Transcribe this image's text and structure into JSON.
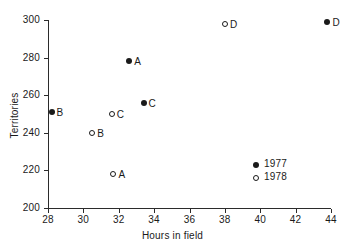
{
  "chart_data": {
    "type": "scatter",
    "title": "",
    "xlabel": "Hours in field",
    "ylabel": "Territories",
    "xlim": [
      28,
      44
    ],
    "ylim": [
      200,
      300
    ],
    "xticks": [
      28,
      30,
      32,
      34,
      36,
      38,
      40,
      42,
      44
    ],
    "yticks": [
      200,
      220,
      240,
      260,
      280,
      300
    ],
    "grid": false,
    "legend_position": "inside-right-lower",
    "series": [
      {
        "name": "1977",
        "marker": "filled-circle",
        "color": "#1a1a1a",
        "points": [
          {
            "label": "B",
            "x": 28.2,
            "y": 251
          },
          {
            "label": "A",
            "x": 32.6,
            "y": 278
          },
          {
            "label": "C",
            "x": 33.4,
            "y": 256
          },
          {
            "label": "D",
            "x": 43.8,
            "y": 299
          }
        ]
      },
      {
        "name": "1978",
        "marker": "open-circle",
        "color": "#1a1a1a",
        "points": [
          {
            "label": "B",
            "x": 30.5,
            "y": 240
          },
          {
            "label": "C",
            "x": 31.6,
            "y": 250
          },
          {
            "label": "A",
            "x": 31.7,
            "y": 218
          },
          {
            "label": "D",
            "x": 38.0,
            "y": 298
          }
        ]
      }
    ]
  },
  "legend": {
    "entries": [
      {
        "label": "1977",
        "marker": "filled-circle"
      },
      {
        "label": "1978",
        "marker": "open-circle"
      }
    ]
  }
}
